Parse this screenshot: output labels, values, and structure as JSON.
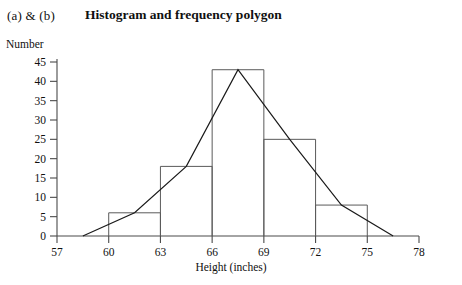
{
  "header": {
    "part_label": "(a) & (b)",
    "title": "Histogram and frequency polygon"
  },
  "axes": {
    "y_axis_name": "Number",
    "x_axis_name": "Height (inches)",
    "y_ticks": [
      0,
      5,
      10,
      15,
      20,
      25,
      30,
      35,
      40,
      45
    ],
    "x_ticks": [
      57,
      60,
      63,
      66,
      69,
      72,
      75,
      78
    ]
  },
  "colors": {
    "background": "#ffffff",
    "axis": "#4a4a4a",
    "bar_stroke": "#5a5a5a",
    "polygon_stroke": "#1a1a1a",
    "text": "#101010"
  },
  "chart_data": {
    "type": "bar",
    "title": "Histogram and frequency polygon",
    "xlabel": "Height (inches)",
    "ylabel": "Number",
    "xlim": [
      57,
      78
    ],
    "ylim": [
      0,
      45
    ],
    "grid": false,
    "legend": "none",
    "bin_width": 3,
    "bin_edges": [
      57,
      60,
      63,
      66,
      69,
      72,
      75,
      78
    ],
    "categories": [
      "57-60",
      "60-63",
      "63-66",
      "66-69",
      "69-72",
      "72-75",
      "75-78"
    ],
    "values": [
      0,
      6,
      18,
      43,
      25,
      8,
      0
    ],
    "series": [
      {
        "name": "Histogram",
        "type": "bar",
        "categories": [
          "57-60",
          "60-63",
          "63-66",
          "66-69",
          "69-72",
          "72-75",
          "75-78"
        ],
        "values": [
          0,
          6,
          18,
          43,
          25,
          8,
          0
        ]
      },
      {
        "name": "Frequency polygon",
        "type": "line",
        "x": [
          58.5,
          61.5,
          64.5,
          67.5,
          70.5,
          73.5,
          76.5
        ],
        "values": [
          0,
          6,
          18,
          43,
          25,
          8,
          0
        ]
      }
    ]
  }
}
